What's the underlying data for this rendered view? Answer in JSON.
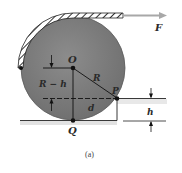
{
  "diagram": {
    "caption": "(a)",
    "labels": {
      "force": "F",
      "center": "O",
      "contact_point": "P",
      "bottom_point": "Q",
      "radius": "R",
      "horizontal_distance": "d",
      "vertical_distance": "R − h",
      "step_height": "h"
    },
    "colors": {
      "wheel_fill": "#7d7d7d",
      "wheel_edge": "#5a5a5a",
      "line": "#222222",
      "rope_arrow": "#a8a8a8",
      "ground_shadow": "#d9d9d9"
    }
  }
}
